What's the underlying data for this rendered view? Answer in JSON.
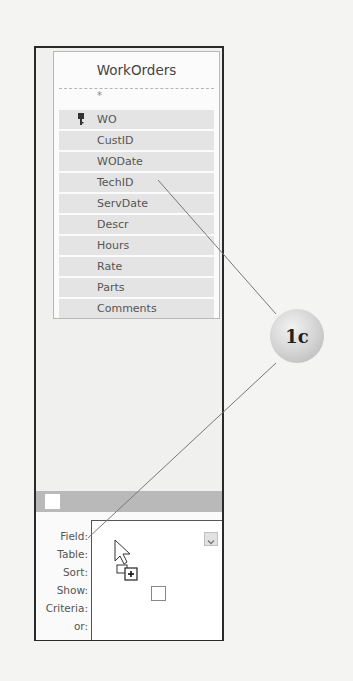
{
  "table": {
    "title": "WorkOrders",
    "all_fields_marker": "*",
    "fields": [
      {
        "name": "WO",
        "primary_key": true
      },
      {
        "name": "CustID",
        "primary_key": false
      },
      {
        "name": "WODate",
        "primary_key": false
      },
      {
        "name": "TechID",
        "primary_key": false
      },
      {
        "name": "ServDate",
        "primary_key": false
      },
      {
        "name": "Descr",
        "primary_key": false
      },
      {
        "name": "Hours",
        "primary_key": false
      },
      {
        "name": "Rate",
        "primary_key": false
      },
      {
        "name": "Parts",
        "primary_key": false
      },
      {
        "name": "Comments",
        "primary_key": false
      }
    ]
  },
  "design_grid": {
    "row_labels": [
      "Field:",
      "Table:",
      "Sort:",
      "Show:",
      "Criteria:",
      "or:"
    ],
    "field_value": "",
    "show_checked": false
  },
  "callout": {
    "label": "1c",
    "points_to": [
      "TechID",
      "Field:"
    ]
  },
  "cursor": {
    "type": "drag-add-cursor"
  },
  "colors": {
    "field_row_bg": "#e4e4e4",
    "gray_bar": "#b9b9b9",
    "callout_bg": "#d2d2d2",
    "frame_border": "#2a2a2a"
  }
}
